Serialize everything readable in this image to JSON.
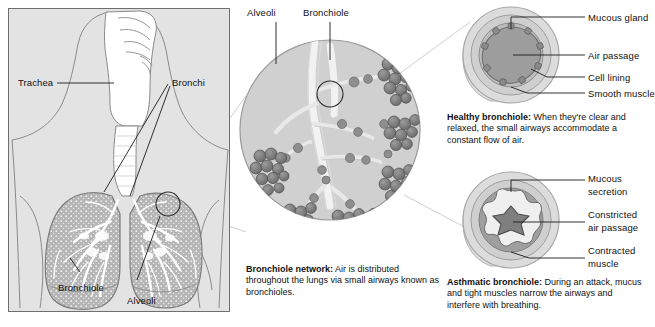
{
  "figure": {
    "background": "#ffffff",
    "panel_fill": "#e3e3e3",
    "ink": "#111111",
    "tissue_fill": "#b9b9b9",
    "lumen_fill": "#9a9a9a"
  },
  "left_panel": {
    "name": "Respiratory system overview",
    "labels": {
      "trachea": "Trachea",
      "bronchi": "Bronchi",
      "bronchiole": "Bronchiole",
      "alveoli": "Alveoli"
    }
  },
  "center_panel": {
    "labels": {
      "alveoli": "Alveoli",
      "bronchiole": "Bronchiole"
    },
    "caption_title": "Bronchiole network:",
    "caption_body_line1": "Air is distributed",
    "caption_body_line2": "throughout the lungs via small airways",
    "caption_body_line3": "known as bronchioles."
  },
  "healthy_panel": {
    "labels": {
      "mucous_gland": "Mucous gland",
      "air_passage": "Air passage",
      "cell_lining": "Cell lining",
      "smooth_muscle": "Smooth muscle"
    },
    "caption_title": "Healthy bronchiole:",
    "caption_body_line1": "When they're clear",
    "caption_body_line2": "and relaxed, the small airways accommodate",
    "caption_body_line3": "a constant flow of air."
  },
  "asthmatic_panel": {
    "labels": {
      "mucous_secretion_l1": "Mucous",
      "mucous_secretion_l2": "secretion",
      "constricted_l1": "Constricted",
      "constricted_l2": "air passage",
      "contracted_l1": "Contracted",
      "contracted_l2": "muscle"
    },
    "caption_title": "Asthmatic bronchiole:",
    "caption_body_line1": "During an attack,",
    "caption_body_line2": "mucus and tight muscles narrow the airways",
    "caption_body_line3": "and interfere with breathing."
  }
}
